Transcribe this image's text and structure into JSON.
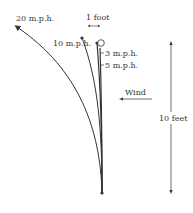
{
  "diagram": {
    "type": "wind-deflection-of-vertical-pole",
    "curves": [
      {
        "label": "20 m.p.h.",
        "endpoint": "arrow"
      },
      {
        "label": "10 m.p.h.",
        "endpoint": "dot"
      },
      {
        "label": "5 m.p.h.",
        "endpoint": "dot"
      },
      {
        "label": "3 m.p.h.",
        "endpoint": "circle"
      }
    ],
    "scale_horizontal": "1 foot",
    "scale_vertical": "10 feet",
    "wind_label": "Wind",
    "colors": {
      "line": "#333333",
      "background": "#ffffff"
    }
  }
}
